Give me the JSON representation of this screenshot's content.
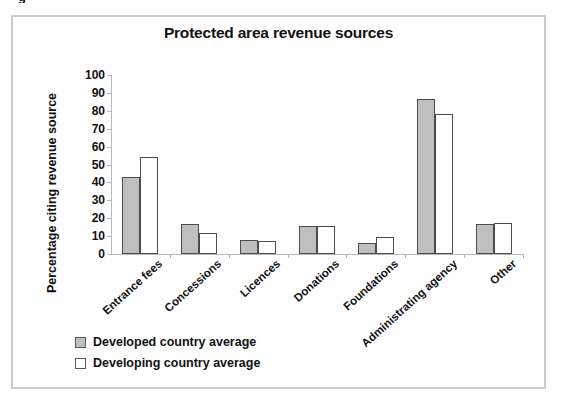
{
  "figure": {
    "clipped_caption_fragment": "g",
    "frame_color": "#c9cbcd",
    "background": "#ffffff"
  },
  "chart_data": {
    "type": "bar",
    "title": "Protected area revenue sources",
    "xlabel": "",
    "ylabel": "Percentage citing revenue source",
    "ylim": [
      0,
      100
    ],
    "ytick_labels": [
      "0",
      "10",
      "20",
      "30",
      "40",
      "50",
      "60",
      "70",
      "80",
      "90",
      "100"
    ],
    "yticks": [
      0,
      10,
      20,
      30,
      40,
      50,
      60,
      70,
      80,
      90,
      100
    ],
    "grid": false,
    "legend_position": "bottom-left",
    "categories": [
      "Entrance fees",
      "Concessions",
      "Licences",
      "Donations",
      "Foundations",
      "Administrating agency",
      "Other"
    ],
    "series": [
      {
        "name": "Developed country average",
        "color": "#bfbfbf",
        "values": [
          43,
          17,
          8,
          15.5,
          6,
          86.5,
          17
        ]
      },
      {
        "name": "Developing country average",
        "color": "#ffffff",
        "values": [
          54,
          12,
          7,
          15.5,
          9.5,
          78,
          17.5
        ]
      }
    ]
  },
  "legend": {
    "items": [
      {
        "label": "Developed country average",
        "swatch": "developed"
      },
      {
        "label": "Developing country average",
        "swatch": "developing"
      }
    ]
  }
}
